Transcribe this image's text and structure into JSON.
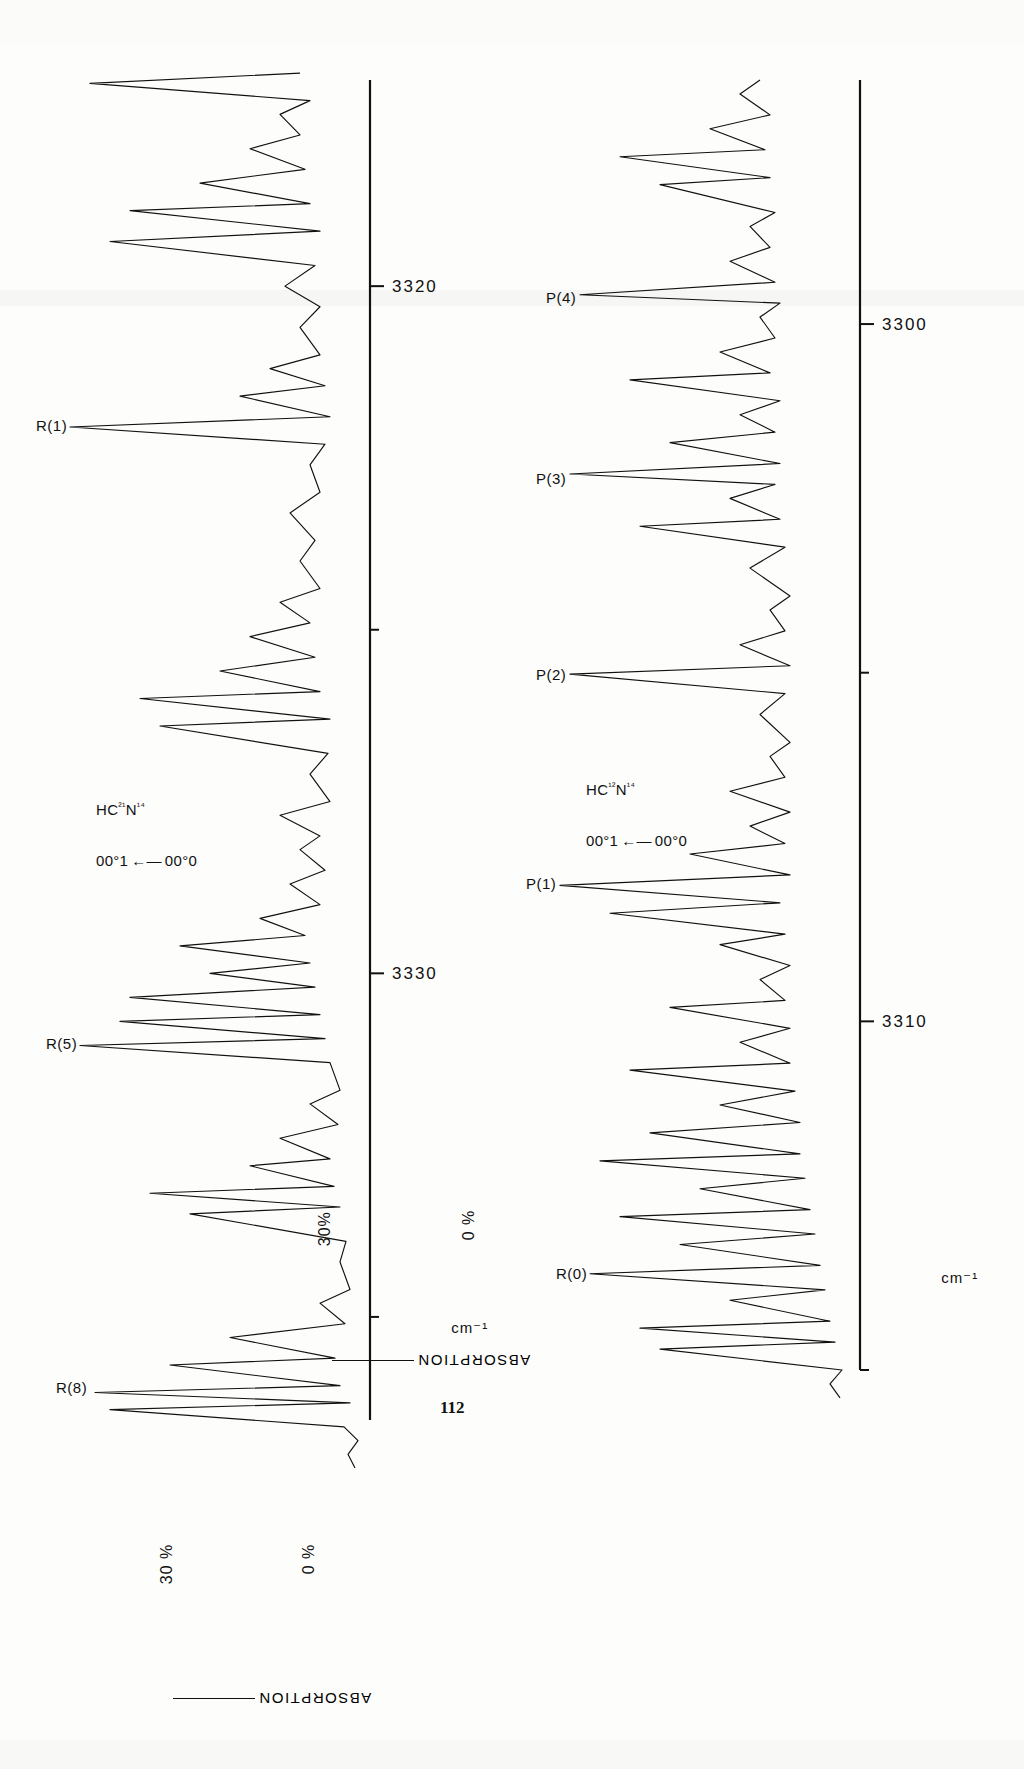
{
  "page": {
    "page_number": "112",
    "background_color": "#fdfdfc",
    "ink_color": "#111111",
    "orientation_note_degrees": -90
  },
  "figure": {
    "axis_unit_label": "cm⁻¹",
    "y_axis_title": "ABSORPTION",
    "y_tick_top": "30 %",
    "y_tick_bottom": "0 %",
    "panels": [
      {
        "id": "upper-panel",
        "species_label_line1": "HC²¹N¹⁴",
        "species_label_line2": "00°1",
        "species_label_arrow": "←—",
        "species_label_line3": "00°0",
        "y_tick_top": "30 %",
        "y_tick_bottom": "0 %",
        "axis_unit_label": "cm⁻¹",
        "x_tick_labels": [
          "3320",
          "3330"
        ],
        "x_tick_values": [
          3320,
          3330
        ],
        "peak_labels": [
          "R(1)",
          "R(5)",
          "R(8)"
        ]
      },
      {
        "id": "lower-panel",
        "species_label_line1": "HC¹²N¹⁴",
        "species_label_line2": "00°1",
        "species_label_arrow": "←—",
        "species_label_line3": "00°0",
        "y_tick_top": "30%",
        "y_tick_bottom": "0 %",
        "axis_unit_label": "cm⁻¹",
        "x_tick_labels": [
          "3300",
          "3310"
        ],
        "x_tick_values": [
          3300,
          3310
        ],
        "peak_labels": [
          "P(4)",
          "P(3)",
          "P(2)",
          "P(1)",
          "R(0)"
        ]
      }
    ]
  },
  "chart_data": {
    "type": "line",
    "xlabel": "cm⁻¹",
    "ylabel": "ABSORPTION",
    "ylim": [
      0,
      30
    ],
    "ytick_labels": [
      "0 %",
      "30 %"
    ],
    "grid": false,
    "legend": "none",
    "charts": [
      {
        "name": "upper-panel",
        "annotation": "HC²¹N¹⁴  00°1 ← 00°0",
        "xlim": [
          3336.5,
          3317.0
        ],
        "xticks": [
          3330,
          3320
        ],
        "minor_xticks": [
          3335,
          3325,
          3315
        ],
        "labeled_peaks": [
          {
            "label": "R(8)",
            "center_cm": 3336.0,
            "depth_pct": 28
          },
          {
            "label": "R(5)",
            "center_cm": 3331.0,
            "depth_pct": 29
          },
          {
            "label": "R(1)",
            "center_cm": 3322.0,
            "depth_pct": 30
          }
        ],
        "baseline_pct": 2,
        "trace_points_cm_pct": [
          [
            3337.2,
            1.5
          ],
          [
            3337.0,
            2.2
          ],
          [
            3336.8,
            1.2
          ],
          [
            3336.6,
            2.6
          ],
          [
            3336.35,
            26.0
          ],
          [
            3336.25,
            2.0
          ],
          [
            3336.1,
            27.5
          ],
          [
            3336.0,
            3.0
          ],
          [
            3335.7,
            20.0
          ],
          [
            3335.6,
            3.5
          ],
          [
            3335.3,
            14.0
          ],
          [
            3335.1,
            2.5
          ],
          [
            3334.8,
            5.0
          ],
          [
            3334.6,
            2.0
          ],
          [
            3334.2,
            3.0
          ],
          [
            3333.9,
            2.4
          ],
          [
            3333.5,
            18.0
          ],
          [
            3333.4,
            3.0
          ],
          [
            3333.2,
            22.0
          ],
          [
            3333.1,
            3.6
          ],
          [
            3332.8,
            12.0
          ],
          [
            3332.7,
            4.0
          ],
          [
            3332.4,
            9.0
          ],
          [
            3332.2,
            3.2
          ],
          [
            3331.9,
            6.0
          ],
          [
            3331.7,
            3.0
          ],
          [
            3331.3,
            4.0
          ],
          [
            3331.05,
            29.0
          ],
          [
            3330.95,
            4.5
          ],
          [
            3330.7,
            25.0
          ],
          [
            3330.6,
            5.0
          ],
          [
            3330.35,
            24.0
          ],
          [
            3330.2,
            5.5
          ],
          [
            3330.0,
            16.0
          ],
          [
            3329.85,
            6.0
          ],
          [
            3329.6,
            19.0
          ],
          [
            3329.45,
            6.5
          ],
          [
            3329.2,
            11.0
          ],
          [
            3329.0,
            5.0
          ],
          [
            3328.7,
            8.0
          ],
          [
            3328.5,
            4.5
          ],
          [
            3328.2,
            7.0
          ],
          [
            3328.0,
            5.0
          ],
          [
            3327.7,
            9.0
          ],
          [
            3327.5,
            4.0
          ],
          [
            3327.1,
            6.0
          ],
          [
            3326.8,
            4.2
          ],
          [
            3326.4,
            21.0
          ],
          [
            3326.3,
            4.0
          ],
          [
            3326.0,
            23.0
          ],
          [
            3325.9,
            5.0
          ],
          [
            3325.6,
            15.0
          ],
          [
            3325.4,
            5.5
          ],
          [
            3325.1,
            12.0
          ],
          [
            3324.9,
            6.0
          ],
          [
            3324.6,
            9.0
          ],
          [
            3324.4,
            5.0
          ],
          [
            3324.0,
            7.0
          ],
          [
            3323.7,
            5.5
          ],
          [
            3323.3,
            8.0
          ],
          [
            3323.0,
            5.0
          ],
          [
            3322.6,
            6.0
          ],
          [
            3322.3,
            4.5
          ],
          [
            3322.05,
            30.0
          ],
          [
            3321.9,
            4.0
          ],
          [
            3321.6,
            13.0
          ],
          [
            3321.45,
            4.5
          ],
          [
            3321.2,
            10.0
          ],
          [
            3321.0,
            5.0
          ],
          [
            3320.6,
            7.0
          ],
          [
            3320.3,
            5.0
          ],
          [
            3320.0,
            8.5
          ],
          [
            3319.7,
            5.5
          ],
          [
            3319.35,
            26.0
          ],
          [
            3319.2,
            5.0
          ],
          [
            3318.9,
            24.0
          ],
          [
            3318.8,
            6.0
          ],
          [
            3318.5,
            17.0
          ],
          [
            3318.3,
            6.5
          ],
          [
            3318.0,
            12.0
          ],
          [
            3317.8,
            7.0
          ],
          [
            3317.5,
            9.0
          ],
          [
            3317.3,
            6.0
          ],
          [
            3317.05,
            28.0
          ],
          [
            3316.9,
            7.0
          ]
        ]
      },
      {
        "name": "lower-panel",
        "annotation": "HC¹²N¹⁴  00°1 ← 00°0",
        "xlim": [
          3315.0,
          3296.5
        ],
        "xticks": [
          3310,
          3300
        ],
        "minor_xticks": [
          3315,
          3305
        ],
        "labeled_peaks": [
          {
            "label": "R(0)",
            "center_cm": 3313.6,
            "depth_pct": 27
          },
          {
            "label": "P(1)",
            "center_cm": 3308.0,
            "depth_pct": 30
          },
          {
            "label": "P(2)",
            "center_cm": 3305.0,
            "depth_pct": 29
          },
          {
            "label": "P(3)",
            "center_cm": 3302.2,
            "depth_pct": 29
          },
          {
            "label": "P(4)",
            "center_cm": 3299.6,
            "depth_pct": 28
          }
        ],
        "baseline_pct": 2,
        "trace_points_cm_pct": [
          [
            3315.4,
            2.0
          ],
          [
            3315.2,
            3.0
          ],
          [
            3315.0,
            1.8
          ],
          [
            3314.7,
            20.0
          ],
          [
            3314.6,
            2.5
          ],
          [
            3314.4,
            22.0
          ],
          [
            3314.3,
            3.0
          ],
          [
            3314.0,
            13.0
          ],
          [
            3313.85,
            3.5
          ],
          [
            3313.62,
            27.0
          ],
          [
            3313.5,
            4.0
          ],
          [
            3313.2,
            18.0
          ],
          [
            3313.05,
            4.5
          ],
          [
            3312.8,
            24.0
          ],
          [
            3312.7,
            5.0
          ],
          [
            3312.4,
            16.0
          ],
          [
            3312.25,
            5.5
          ],
          [
            3312.0,
            26.0
          ],
          [
            3311.9,
            6.0
          ],
          [
            3311.6,
            21.0
          ],
          [
            3311.45,
            6.0
          ],
          [
            3311.2,
            14.0
          ],
          [
            3311.0,
            6.5
          ],
          [
            3310.7,
            23.0
          ],
          [
            3310.6,
            7.0
          ],
          [
            3310.3,
            12.0
          ],
          [
            3310.1,
            7.0
          ],
          [
            3309.8,
            19.0
          ],
          [
            3309.7,
            7.5
          ],
          [
            3309.4,
            10.0
          ],
          [
            3309.2,
            7.0
          ],
          [
            3308.9,
            14.0
          ],
          [
            3308.75,
            7.5
          ],
          [
            3308.45,
            25.0
          ],
          [
            3308.3,
            8.0
          ],
          [
            3308.05,
            30.0
          ],
          [
            3307.9,
            7.0
          ],
          [
            3307.6,
            17.0
          ],
          [
            3307.45,
            7.5
          ],
          [
            3307.2,
            11.0
          ],
          [
            3307.0,
            7.0
          ],
          [
            3306.7,
            13.0
          ],
          [
            3306.5,
            7.5
          ],
          [
            3306.2,
            9.0
          ],
          [
            3306.0,
            7.0
          ],
          [
            3305.6,
            10.0
          ],
          [
            3305.3,
            7.5
          ],
          [
            3305.02,
            29.0
          ],
          [
            3304.9,
            7.0
          ],
          [
            3304.6,
            12.0
          ],
          [
            3304.4,
            7.5
          ],
          [
            3304.1,
            9.0
          ],
          [
            3303.9,
            7.0
          ],
          [
            3303.5,
            11.0
          ],
          [
            3303.2,
            7.5
          ],
          [
            3302.9,
            22.0
          ],
          [
            3302.8,
            8.0
          ],
          [
            3302.5,
            13.0
          ],
          [
            3302.3,
            8.5
          ],
          [
            3302.15,
            29.0
          ],
          [
            3302.0,
            8.0
          ],
          [
            3301.7,
            19.0
          ],
          [
            3301.55,
            8.5
          ],
          [
            3301.3,
            12.0
          ],
          [
            3301.1,
            8.0
          ],
          [
            3300.8,
            23.0
          ],
          [
            3300.7,
            9.0
          ],
          [
            3300.4,
            14.0
          ],
          [
            3300.2,
            8.5
          ],
          [
            3299.9,
            10.0
          ],
          [
            3299.7,
            8.0
          ],
          [
            3299.58,
            28.0
          ],
          [
            3299.4,
            8.5
          ],
          [
            3299.1,
            13.0
          ],
          [
            3298.9,
            9.0
          ],
          [
            3298.6,
            11.0
          ],
          [
            3298.4,
            8.5
          ],
          [
            3298.0,
            20.0
          ],
          [
            3297.9,
            9.0
          ],
          [
            3297.6,
            24.0
          ],
          [
            3297.5,
            9.5
          ],
          [
            3297.2,
            15.0
          ],
          [
            3297.0,
            9.0
          ],
          [
            3296.7,
            12.0
          ],
          [
            3296.5,
            10.0
          ]
        ]
      }
    ]
  }
}
